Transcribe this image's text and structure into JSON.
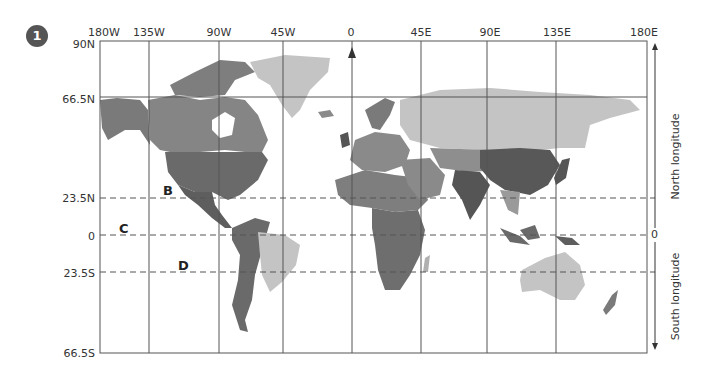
{
  "figure": {
    "number": "1"
  },
  "longitude_labels": [
    "180W",
    "135W",
    "90W",
    "45W",
    "0",
    "45E",
    "90E",
    "135E",
    "180E"
  ],
  "latitude_labels": [
    "90N",
    "66.5N",
    "23.5N",
    "0",
    "23.5S",
    "66.5S"
  ],
  "points": {
    "A": "A",
    "B": "B",
    "C": "C",
    "D": "D"
  },
  "right_axis": {
    "zero_label": "0",
    "north_label": "North longitude",
    "south_label": "South longitude"
  },
  "colors": {
    "grid": "#555555",
    "land_light": "#c4c4c4",
    "land_mid": "#8a8a8a",
    "land_dark": "#5e5e5e",
    "badge": "#555555"
  }
}
